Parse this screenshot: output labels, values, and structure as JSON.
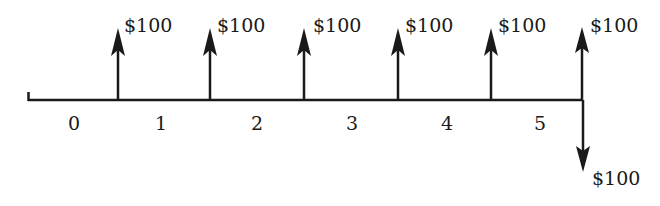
{
  "diagram": {
    "type": "cash-flow-timeline",
    "periods": [
      "0",
      "1",
      "2",
      "3",
      "4",
      "5"
    ],
    "inflows": [
      {
        "label": "$100",
        "x": 118
      },
      {
        "label": "$100",
        "x": 210
      },
      {
        "label": "$100",
        "x": 304
      },
      {
        "label": "$100",
        "x": 398
      },
      {
        "label": "$100",
        "x": 491
      },
      {
        "label": "$100",
        "x": 582
      }
    ],
    "outflows": [
      {
        "label": "$100",
        "x": 583
      }
    ],
    "colors": {
      "ink": "#1a1a1a",
      "background": "#ffffff"
    }
  }
}
